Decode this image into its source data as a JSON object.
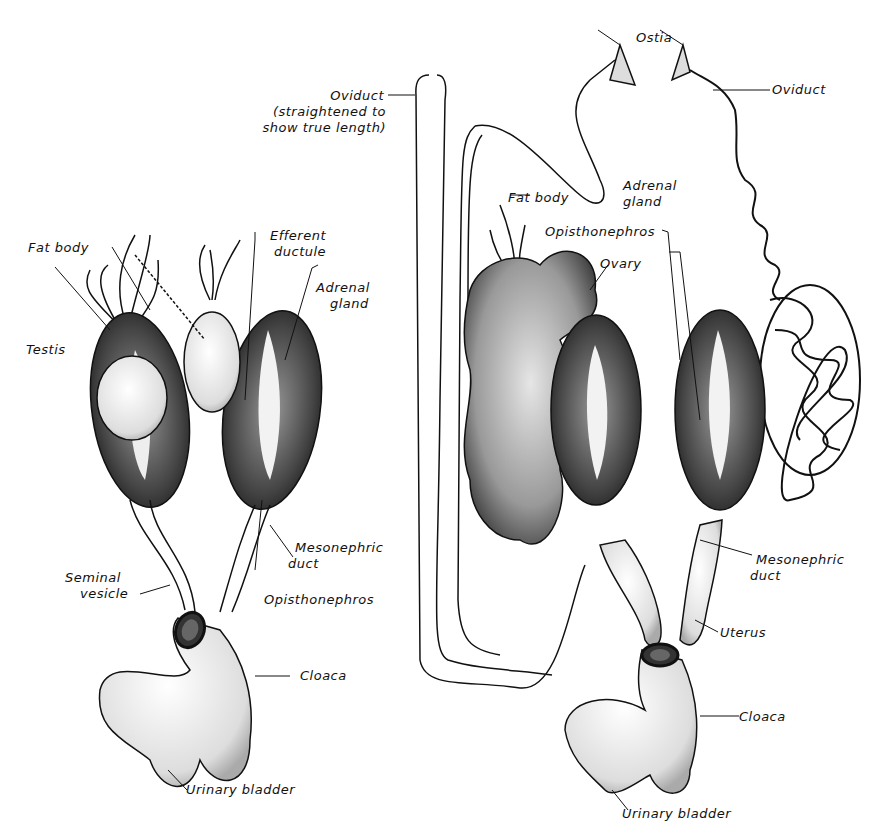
{
  "figure": {
    "male_panel": {
      "labels": {
        "fat_body": "Fat body",
        "efferent_ductule_1": "Efferent",
        "efferent_ductule_2": "ductule",
        "adrenal_gland_1": "Adrenal",
        "adrenal_gland_2": "gland",
        "testis": "Testis",
        "mesonephric_duct_1": "Mesonephric",
        "mesonephric_duct_2": "duct",
        "seminal_vesicle_1": "Seminal",
        "seminal_vesicle_2": "vesicle",
        "opisthonephros": "Opisthonephros",
        "cloaca": "Cloaca",
        "urinary_bladder": "Urinary bladder"
      }
    },
    "female_panel": {
      "labels": {
        "oviduct_straight_1": "Oviduct",
        "oviduct_straight_2": "(straightened to",
        "oviduct_straight_3": "show true length)",
        "ostia": "Ostia",
        "oviduct": "Oviduct",
        "fat_body": "Fat body",
        "adrenal_gland_1": "Adrenal",
        "adrenal_gland_2": "gland",
        "opisthonephros": "Opisthonephros",
        "ovary": "Ovary",
        "mesonephric_duct_1": "Mesonephric",
        "mesonephric_duct_2": "duct",
        "uterus": "Uterus",
        "cloaca": "Cloaca",
        "urinary_bladder": "Urinary bladder"
      }
    },
    "colors": {
      "ink": "#111111",
      "stipple": "#555555",
      "paper": "#ffffff"
    }
  }
}
